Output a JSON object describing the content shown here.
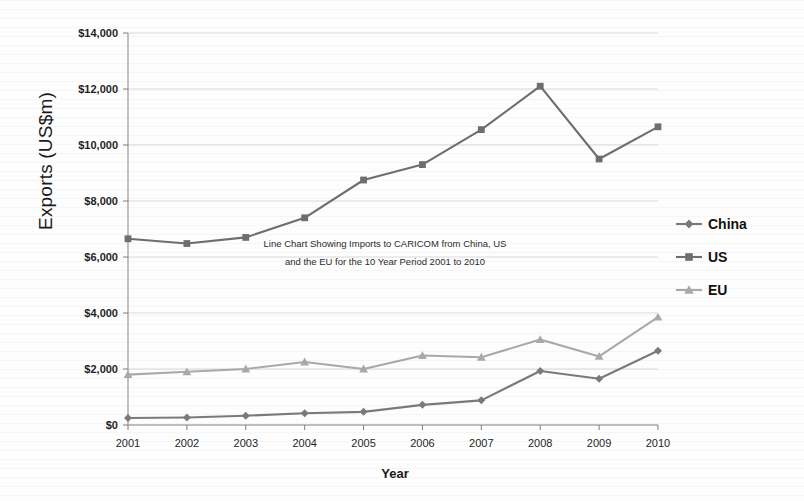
{
  "chart_data": {
    "type": "line",
    "title": "",
    "annotation": [
      "Line Chart Showing Imports to CARICOM from China, US",
      "and the EU for the 10 Year Period 2001 to 2010"
    ],
    "xlabel": "Year",
    "ylabel": "Exports (US$m)",
    "categories": [
      "2001",
      "2002",
      "2003",
      "2004",
      "2005",
      "2006",
      "2007",
      "2008",
      "2009",
      "2010"
    ],
    "ylim": [
      0,
      14000
    ],
    "ytick_values": [
      0,
      2000,
      4000,
      6000,
      8000,
      10000,
      12000,
      14000
    ],
    "ytick_labels": [
      "$0",
      "$2,000",
      "$4,000",
      "$6,000",
      "$8,000",
      "$10,000",
      "$12,000",
      "$14,000"
    ],
    "grid": true,
    "legend_position": "right",
    "series": [
      {
        "name": "China",
        "marker": "diamond",
        "color": "#7a7a7a",
        "values": [
          250,
          270,
          330,
          420,
          470,
          720,
          880,
          1930,
          1650,
          2650
        ]
      },
      {
        "name": "US",
        "marker": "square",
        "color": "#6e6e6e",
        "values": [
          6650,
          6480,
          6700,
          7400,
          8750,
          9300,
          10550,
          12100,
          9500,
          10650
        ]
      },
      {
        "name": "EU",
        "marker": "triangle",
        "color": "#a9a9a9",
        "values": [
          1800,
          1900,
          2000,
          2250,
          2000,
          2480,
          2420,
          3050,
          2450,
          3850
        ]
      }
    ]
  },
  "legend": {
    "items": [
      {
        "label": "China"
      },
      {
        "label": "US"
      },
      {
        "label": "EU"
      }
    ]
  },
  "axes": {
    "x_title": "Year",
    "y_title": "Exports (US$m)"
  }
}
